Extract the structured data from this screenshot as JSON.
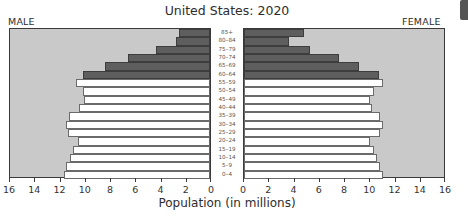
{
  "chart_data": {
    "type": "bar",
    "subtype": "population-pyramid",
    "title": "United States: 2020",
    "xlabel": "Population (in millions)",
    "ylabel": "",
    "categories": [
      "85+",
      "80–84",
      "75–79",
      "70–74",
      "65–69",
      "60–64",
      "55–59",
      "50–54",
      "45–49",
      "40–44",
      "35–39",
      "30–34",
      "25–29",
      "20–24",
      "15–19",
      "10–14",
      "5–9",
      "0–4"
    ],
    "series": [
      {
        "name": "MALE",
        "side": "left",
        "values": [
          2.5,
          2.7,
          4.3,
          6.6,
          8.4,
          10.2,
          10.7,
          10.2,
          10.1,
          10.5,
          11.3,
          11.5,
          11.4,
          10.6,
          11.0,
          11.2,
          11.5,
          11.7
        ]
      },
      {
        "name": "FEMALE",
        "side": "right",
        "values": [
          4.8,
          3.6,
          5.3,
          7.6,
          9.2,
          10.8,
          11.1,
          10.4,
          10.1,
          10.2,
          10.9,
          11.1,
          10.9,
          10.1,
          10.4,
          10.6,
          10.9,
          11.1
        ]
      }
    ],
    "highlight": {
      "ages_65_plus_shaded_dark": [
        "85+",
        "80–84",
        "75–79",
        "70–74",
        "65–69",
        "60–64"
      ]
    },
    "xlim": [
      0,
      16
    ],
    "xticks_left": [
      "16",
      "14",
      "12",
      "10",
      "8",
      "6",
      "4",
      "2",
      "0"
    ],
    "xticks_right": [
      "0",
      "2",
      "4",
      "6",
      "8",
      "10",
      "12",
      "14",
      "16"
    ],
    "grid": false,
    "legend": "side labels MALE (top-left), FEMALE (top-right)",
    "colors": {
      "background_fill": "#c9c9c9",
      "older_bars": "#5e5e5e",
      "younger_bars": "#ffffff",
      "frame": "#3a3a3a"
    }
  },
  "header": {
    "title": "United States: 2020"
  },
  "labels": {
    "male": "MALE",
    "female": "FEMALE",
    "xlabel": "Population (in millions)"
  }
}
